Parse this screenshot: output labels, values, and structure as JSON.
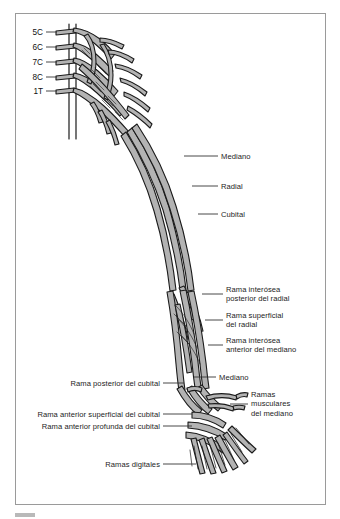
{
  "figure": {
    "frame_color": "#9a9a9a",
    "background_color": "#ffffff",
    "nerve_fill_color": "#b3b3b3",
    "nerve_outline_color": "#1a1a1a",
    "label_color": "#1d1d1d",
    "leader_color": "#333333"
  },
  "spinal_roots": [
    {
      "id": "root-5c",
      "label": "5C"
    },
    {
      "id": "root-6c",
      "label": "6C"
    },
    {
      "id": "root-7c",
      "label": "7C"
    },
    {
      "id": "root-8c",
      "label": "8C"
    },
    {
      "id": "root-1t",
      "label": "1T"
    }
  ],
  "labels_right": [
    {
      "id": "mediano-arm",
      "text": "Mediano"
    },
    {
      "id": "radial-arm",
      "text": "Radial"
    },
    {
      "id": "cubital-arm",
      "text": "Cubital"
    },
    {
      "id": "rama-interosea-posterior-radial",
      "text": "Rama interósea\nposterior del radial"
    },
    {
      "id": "rama-superficial-radial",
      "text": "Rama superficial\ndel radial"
    },
    {
      "id": "rama-interosea-anterior-mediano",
      "text": "Rama interósea\nanterior del mediano"
    },
    {
      "id": "mediano-forearm",
      "text": "Mediano"
    },
    {
      "id": "ramas-musculares-mediano",
      "text": "Ramas\nmusculares\ndel mediano"
    }
  ],
  "labels_left": [
    {
      "id": "rama-posterior-cubital",
      "text": "Rama posterior del cubital"
    },
    {
      "id": "rama-anterior-superficial-cubital",
      "text": "Rama anterior superficial del cubital"
    },
    {
      "id": "rama-anterior-profunda-cubital",
      "text": "Rama anterior profunda del cubital"
    },
    {
      "id": "ramas-digitales",
      "text": "Ramas digitales"
    }
  ],
  "footer": {
    "caption_fragment": "          "
  }
}
